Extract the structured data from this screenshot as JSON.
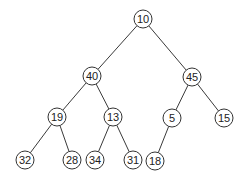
{
  "diagram": {
    "type": "binary-tree",
    "node_radius": 9,
    "colors": {
      "stroke": "#333333",
      "fill": "#ffffff",
      "text": "#222222"
    },
    "nodes": [
      {
        "id": "n10",
        "label": "10",
        "x": 143,
        "y": 19
      },
      {
        "id": "n40",
        "label": "40",
        "x": 92,
        "y": 76
      },
      {
        "id": "n45",
        "label": "45",
        "x": 192,
        "y": 77
      },
      {
        "id": "n19",
        "label": "19",
        "x": 57,
        "y": 117
      },
      {
        "id": "n13",
        "label": "13",
        "x": 113,
        "y": 117
      },
      {
        "id": "n5",
        "label": "5",
        "x": 172,
        "y": 118
      },
      {
        "id": "n15",
        "label": "15",
        "x": 224,
        "y": 118
      },
      {
        "id": "n32",
        "label": "32",
        "x": 25,
        "y": 160
      },
      {
        "id": "n28",
        "label": "28",
        "x": 72,
        "y": 160
      },
      {
        "id": "n34",
        "label": "34",
        "x": 95,
        "y": 160
      },
      {
        "id": "n31",
        "label": "31",
        "x": 133,
        "y": 160
      },
      {
        "id": "n18",
        "label": "18",
        "x": 155,
        "y": 161
      }
    ],
    "edges": [
      [
        "n10",
        "n40"
      ],
      [
        "n10",
        "n45"
      ],
      [
        "n40",
        "n19"
      ],
      [
        "n40",
        "n13"
      ],
      [
        "n45",
        "n5"
      ],
      [
        "n45",
        "n15"
      ],
      [
        "n19",
        "n32"
      ],
      [
        "n19",
        "n28"
      ],
      [
        "n13",
        "n34"
      ],
      [
        "n13",
        "n31"
      ],
      [
        "n5",
        "n18"
      ]
    ]
  }
}
